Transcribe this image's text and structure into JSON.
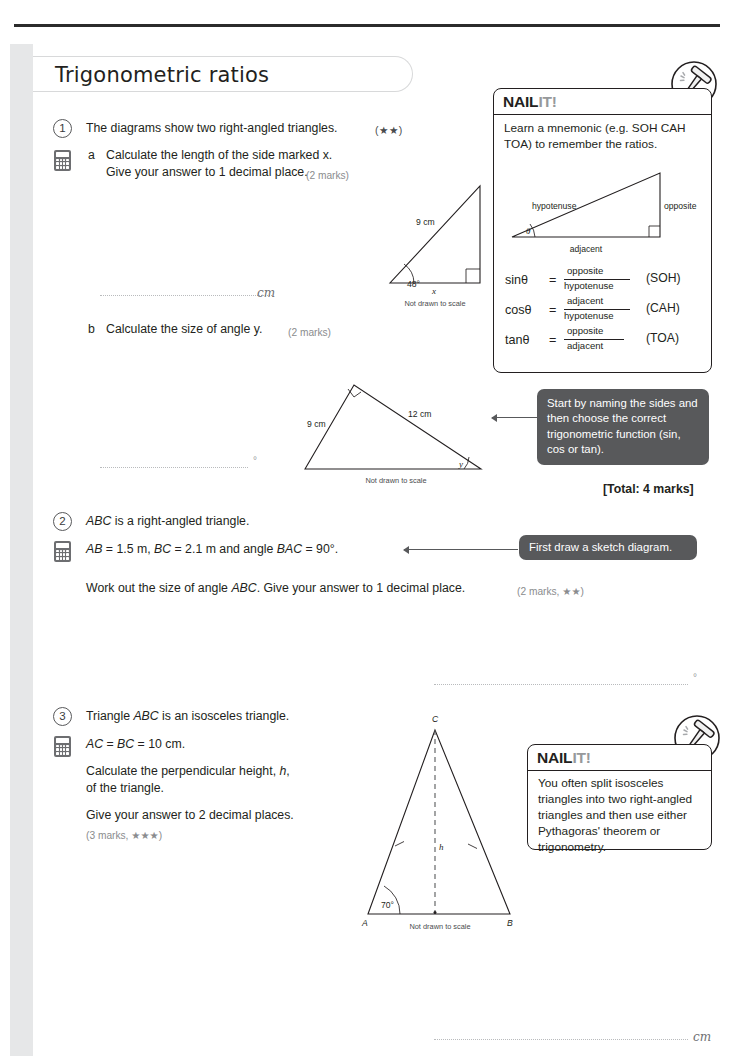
{
  "page": {
    "title": "Trigonometric ratios",
    "total_marks": "[Total: 4 marks]"
  },
  "questions": [
    {
      "number": "1",
      "stem": "The diagrams show two right-angled triangles.",
      "stars": "(★★)",
      "parts": [
        {
          "letter": "a",
          "line1": "Calculate the length of the side marked x.",
          "line2": "Give your answer to 1 decimal place.",
          "marks": "(2 marks)",
          "answer_unit": "cm"
        },
        {
          "letter": "b",
          "line1": "Calculate the size of angle y.",
          "marks": "(2 marks)",
          "answer_unit": "°"
        }
      ]
    },
    {
      "number": "2",
      "line1": "ABC is a right-angled triangle.",
      "line2": "AB = 1.5 m, BC = 2.1 m and angle BAC = 90°.",
      "line3": "Work out the size of angle ABC. Give your answer to 1 decimal place.",
      "marks": "(2 marks, ★★)",
      "answer_unit": "°"
    },
    {
      "number": "3",
      "line1": "Triangle ABC is an isosceles triangle.",
      "line2": "AC = BC = 10 cm.",
      "line3": "Calculate the perpendicular height, h,",
      "line4": "of the triangle.",
      "line5": "Give your answer to 2 decimal places.",
      "marks": "(3 marks, ★★★)",
      "answer_unit": "cm"
    }
  ],
  "nailit_1": {
    "label_a": "NAIL",
    "label_b": "IT!",
    "text_line1": "Learn a mnemonic (e.g. SOH CAH",
    "text_line2": "TOA) to remember the ratios.",
    "diagram": {
      "hypotenuse": "hypotenuse",
      "opposite": "opposite",
      "adjacent": "adjacent",
      "theta": "θ"
    },
    "ratios": [
      {
        "fn": "sinθ",
        "num": "opposite",
        "den": "hypotenuse",
        "mnemonic": "(SOH)"
      },
      {
        "fn": "cosθ",
        "num": "adjacent",
        "den": "hypotenuse",
        "mnemonic": "(CAH)"
      },
      {
        "fn": "tanθ",
        "num": "opposite",
        "den": "adjacent",
        "mnemonic": "(TOA)"
      }
    ]
  },
  "nailit_2": {
    "label_a": "NAIL",
    "label_b": "IT!",
    "text": "You often split isosceles triangles into two right-angled triangles and then use either Pythagoras' theorem or trigonometry."
  },
  "hints": [
    {
      "text": "Start by naming the sides and then choose the correct trigonometric function (sin, cos or tan)."
    },
    {
      "text": "First draw a sketch diagram."
    }
  ],
  "diagrams": {
    "triangle_1a": {
      "angle": "48°",
      "hypotenuse_label": "9 cm",
      "base_label": "x",
      "caption": "Not drawn to scale"
    },
    "triangle_1b": {
      "left_label": "9 cm",
      "right_label": "12 cm",
      "angle_label": "y",
      "caption": "Not drawn to scale"
    },
    "triangle_3": {
      "apex": "C",
      "left_vertex": "A",
      "right_vertex": "B",
      "angle": "70°",
      "height_label": "h",
      "caption": "Not drawn to scale"
    }
  },
  "colors": {
    "ink": "#231f20",
    "hint_bg": "#58595b",
    "muted": "#8a8c8e",
    "strip": "#e6e7e8"
  }
}
